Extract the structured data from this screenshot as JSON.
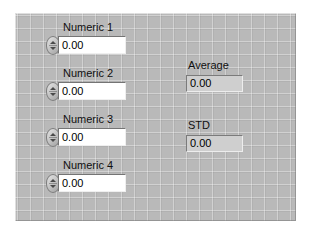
{
  "panel": {
    "background_color": "#b9b9b9",
    "grid": true
  },
  "controls": [
    {
      "label": "Numeric 1",
      "value": "0.00",
      "spinner": "increment-decrement-spinner"
    },
    {
      "label": "Numeric 2",
      "value": "0.00",
      "spinner": "increment-decrement-spinner"
    },
    {
      "label": "Numeric 3",
      "value": "0.00",
      "spinner": "increment-decrement-spinner"
    },
    {
      "label": "Numeric 4",
      "value": "0.00",
      "spinner": "increment-decrement-spinner"
    }
  ],
  "indicators": [
    {
      "label": "Average",
      "value": "0.00"
    },
    {
      "label": "STD",
      "value": "0.00"
    }
  ]
}
